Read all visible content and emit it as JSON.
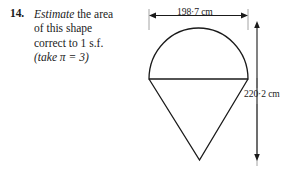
{
  "question": {
    "number": "14.",
    "emphasis_word": "Estimate",
    "line1_rest": " the area",
    "line2": "of this shape",
    "line3": "correct to 1 s.f.",
    "line4": "(take π = 3)",
    "full_text": "Estimate the area of this shape correct to 1 s.f. (take π = 3)"
  },
  "figure": {
    "name": "semicircle-on-inverted-triangle",
    "width_dimension": {
      "label": "198·7 cm",
      "value": 198.7,
      "unit": "cm",
      "orientation": "horizontal",
      "arrow_style": "double-headed"
    },
    "height_dimension": {
      "label": "220·2 cm",
      "value": 220.2,
      "unit": "cm",
      "orientation": "vertical",
      "arrow_style": "double-headed"
    },
    "stroke_color": "#1a1a1a",
    "guide_color": "#9a9a9a"
  }
}
